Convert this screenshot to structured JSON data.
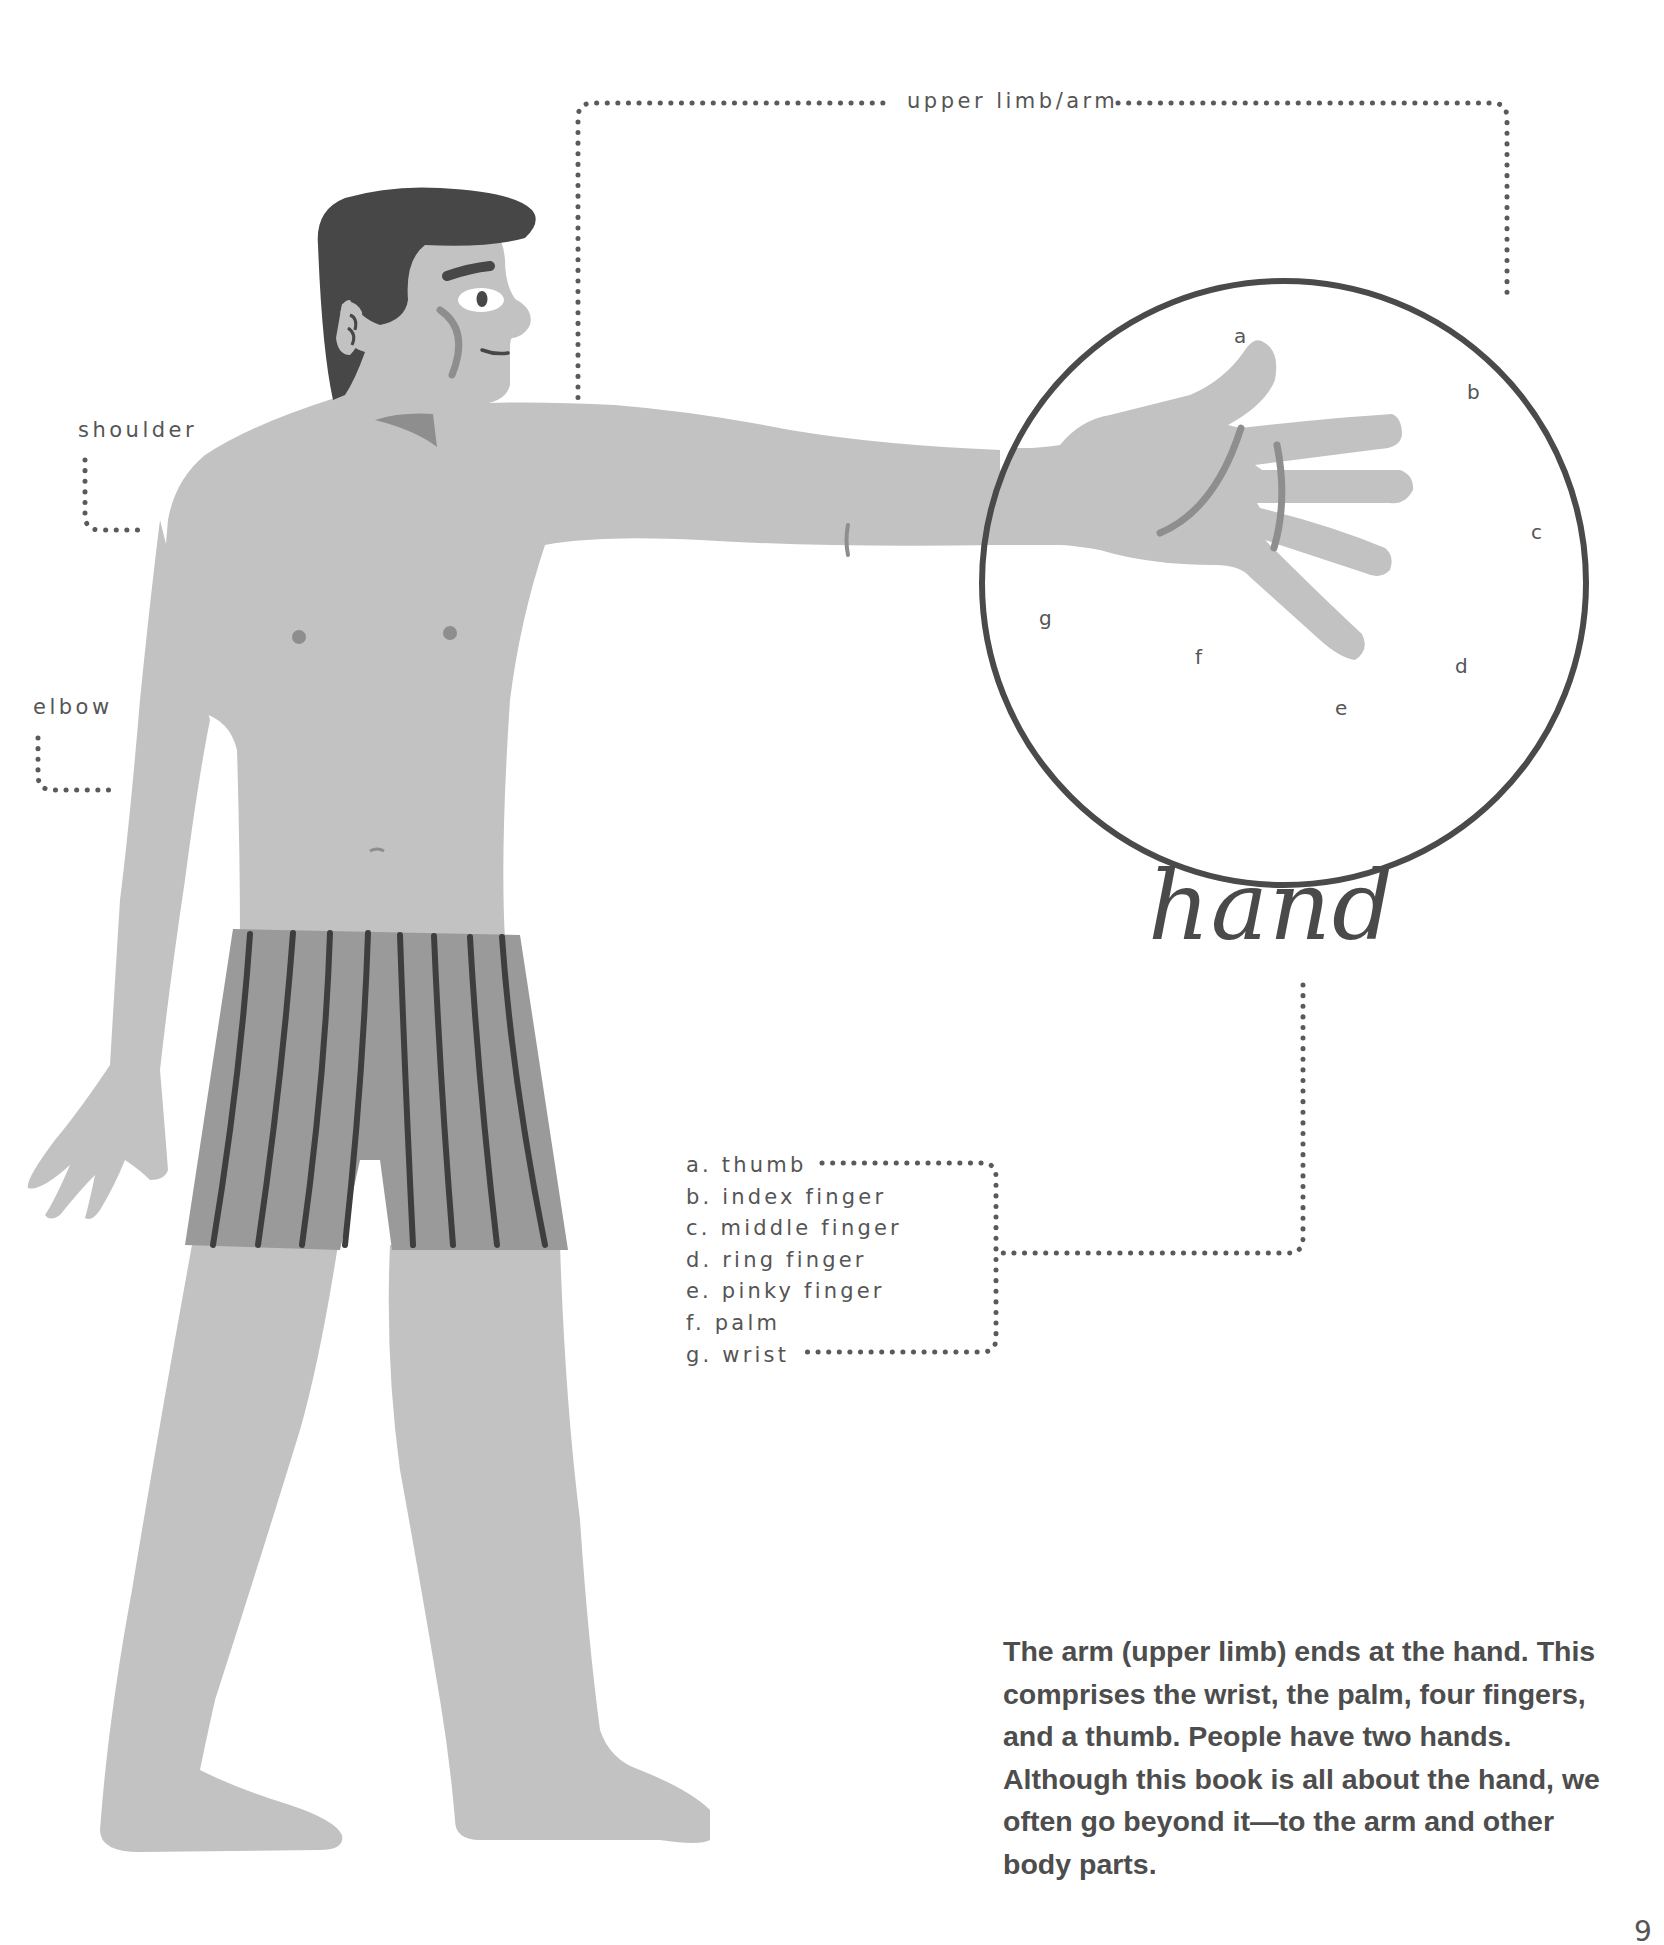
{
  "colors": {
    "background": "#ffffff",
    "skin": "#c2c2c2",
    "skin_shadow": "#8e8e8e",
    "hair": "#474747",
    "shorts": "#9a9a9a",
    "stripes": "#3e3e3e",
    "outline": "#4a4a4a",
    "dots": "#5a5a5a",
    "text": "#555555"
  },
  "labels": {
    "upper_limb": "upper limb/arm",
    "shoulder": "shoulder",
    "elbow": "elbow"
  },
  "hand_callouts": {
    "a": "a",
    "b": "b",
    "c": "c",
    "d": "d",
    "e": "e",
    "f": "f",
    "g": "g"
  },
  "title": "hand",
  "legend": [
    {
      "letter": "a.",
      "name": "thumb"
    },
    {
      "letter": "b.",
      "name": "index finger"
    },
    {
      "letter": "c.",
      "name": "middle finger"
    },
    {
      "letter": "d.",
      "name": "ring finger"
    },
    {
      "letter": "e.",
      "name": "pinky finger"
    },
    {
      "letter": "f.",
      "name": "palm"
    },
    {
      "letter": "g.",
      "name": "wrist"
    }
  ],
  "legend_text": [
    "a. thumb",
    "b. index finger",
    "c. middle finger",
    "d. ring finger",
    "e. pinky finger",
    "f. palm",
    "g. wrist"
  ],
  "body_text": "The arm (upper limb) ends at the hand. This comprises the wrist, the palm, four fingers, and a thumb. People have two hands. Although this book is all about the hand, we often go beyond it—to the arm and other body parts.",
  "page_number": "9"
}
